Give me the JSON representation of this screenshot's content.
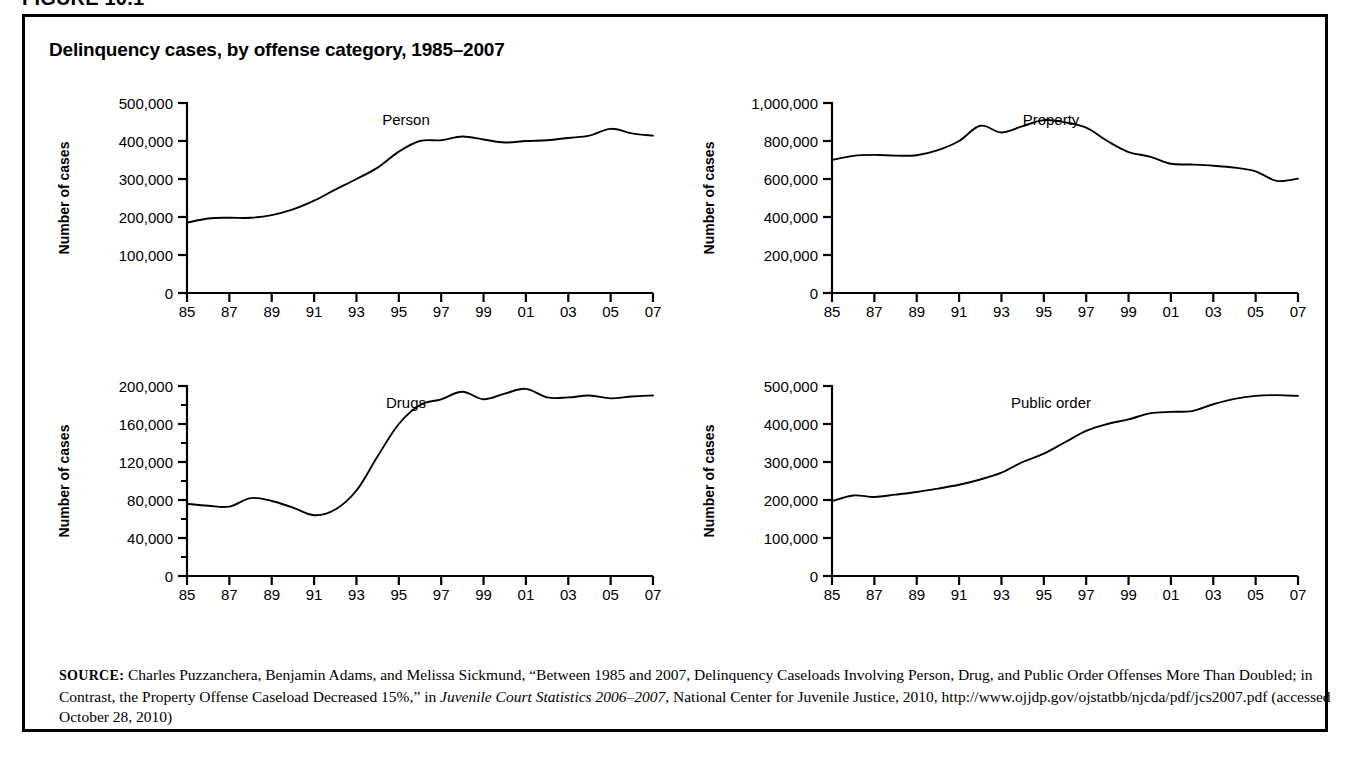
{
  "figure": {
    "number_label": "FIGURE 10.1",
    "title": "Delinquency cases, by offense category, 1985–2007"
  },
  "source": {
    "kicker": "SOURCE:",
    "text_part1": " Charles Puzzanchera, Benjamin Adams, and Melissa Sickmund, “Between 1985 and 2007, Delinquency Caseloads Involving Person, Drug, and Public Order Offenses More Than Doubled; in Contrast, the Property Offense Caseload Decreased 15%,” in ",
    "italic_title": "Juvenile Court Statistics 2006–2007",
    "text_part2": ", National Center for Juvenile Justice, 2010, http://www.ojjdp.gov/ojstatbb/njcda/pdf/jcs2007.pdf (accessed October 28, 2010)"
  },
  "common": {
    "ylabel": "Number of cases",
    "xtick_labels": [
      "85",
      "87",
      "89",
      "91",
      "93",
      "95",
      "97",
      "99",
      "01",
      "03",
      "05",
      "07"
    ],
    "years": [
      1985,
      1986,
      1987,
      1988,
      1989,
      1990,
      1991,
      1992,
      1993,
      1994,
      1995,
      1996,
      1997,
      1998,
      1999,
      2000,
      2001,
      2002,
      2003,
      2004,
      2005,
      2006,
      2007
    ],
    "line_color": "#000000"
  },
  "chart_data": [
    {
      "type": "line",
      "id": "person",
      "title": "Person",
      "series_label": "Person",
      "xlabel": "",
      "ylabel": "Number of cases",
      "x": [
        1985,
        1986,
        1987,
        1988,
        1989,
        1990,
        1991,
        1992,
        1993,
        1994,
        1995,
        1996,
        1997,
        1998,
        1999,
        2000,
        2001,
        2002,
        2003,
        2004,
        2005,
        2006,
        2007
      ],
      "values": [
        185000,
        196000,
        198000,
        198000,
        205000,
        220000,
        243000,
        272000,
        300000,
        330000,
        372000,
        400000,
        402000,
        412000,
        404000,
        396000,
        400000,
        402000,
        408000,
        414000,
        432000,
        420000,
        414000
      ],
      "ylim": [
        0,
        500000
      ],
      "yticks": [
        0,
        100000,
        200000,
        300000,
        400000,
        500000
      ],
      "ytick_labels": [
        "0",
        "100,000",
        "200,000",
        "300,000",
        "400,000",
        "500,000"
      ],
      "minor_yticks": [],
      "xtick_labels": [
        "85",
        "87",
        "89",
        "91",
        "93",
        "95",
        "97",
        "99",
        "01",
        "03",
        "05",
        "07"
      ],
      "grid": false,
      "legend": "none"
    },
    {
      "type": "line",
      "id": "property",
      "title": "Property",
      "series_label": "Property",
      "xlabel": "",
      "ylabel": "Number of cases",
      "x": [
        1985,
        1986,
        1987,
        1988,
        1989,
        1990,
        1991,
        1992,
        1993,
        1994,
        1995,
        1996,
        1997,
        1998,
        1999,
        2000,
        2001,
        2002,
        2003,
        2004,
        2005,
        2006,
        2007
      ],
      "values": [
        700000,
        722000,
        727000,
        723000,
        725000,
        752000,
        800000,
        880000,
        845000,
        878000,
        910000,
        898000,
        870000,
        800000,
        742000,
        718000,
        680000,
        676000,
        670000,
        660000,
        640000,
        590000,
        602000
      ],
      "ylim": [
        0,
        1000000
      ],
      "yticks": [
        0,
        200000,
        400000,
        600000,
        800000,
        1000000
      ],
      "ytick_labels": [
        "0",
        "200,000",
        "400,000",
        "600,000",
        "800,000",
        "1,000,000"
      ],
      "minor_yticks": [],
      "xtick_labels": [
        "85",
        "87",
        "89",
        "91",
        "93",
        "95",
        "97",
        "99",
        "01",
        "03",
        "05",
        "07"
      ],
      "grid": false,
      "legend": "none"
    },
    {
      "type": "line",
      "id": "drugs",
      "title": "Drugs",
      "series_label": "Drugs",
      "xlabel": "",
      "ylabel": "Number of cases",
      "x": [
        1985,
        1986,
        1987,
        1988,
        1989,
        1990,
        1991,
        1992,
        1993,
        1994,
        1995,
        1996,
        1997,
        1998,
        1999,
        2000,
        2001,
        2002,
        2003,
        2004,
        2005,
        2006,
        2007
      ],
      "values": [
        76000,
        74000,
        73000,
        82000,
        79000,
        72000,
        64000,
        70000,
        90000,
        126000,
        160000,
        180000,
        186000,
        194000,
        186000,
        192000,
        197000,
        188000,
        188000,
        190000,
        187000,
        189000,
        190000
      ],
      "ylim": [
        0,
        200000
      ],
      "yticks": [
        0,
        40000,
        80000,
        120000,
        160000,
        200000
      ],
      "ytick_labels": [
        "0",
        "40,000",
        "80,000",
        "120,000",
        "160,000",
        "200,000"
      ],
      "minor_yticks": [
        20000,
        60000,
        100000,
        140000,
        180000
      ],
      "xtick_labels": [
        "85",
        "87",
        "89",
        "91",
        "93",
        "95",
        "97",
        "99",
        "01",
        "03",
        "05",
        "07"
      ],
      "grid": false,
      "legend": "none"
    },
    {
      "type": "line",
      "id": "public-order",
      "title": "Public order",
      "series_label": "Public order",
      "xlabel": "",
      "ylabel": "Number of cases",
      "x": [
        1985,
        1986,
        1987,
        1988,
        1989,
        1990,
        1991,
        1992,
        1993,
        1994,
        1995,
        1996,
        1997,
        1998,
        1999,
        2000,
        2001,
        2002,
        2003,
        2004,
        2005,
        2006,
        2007
      ],
      "values": [
        197000,
        212000,
        208000,
        214000,
        221000,
        230000,
        240000,
        254000,
        272000,
        300000,
        322000,
        352000,
        382000,
        400000,
        412000,
        428000,
        432000,
        434000,
        452000,
        466000,
        474000,
        476000,
        474000
      ],
      "ylim": [
        0,
        500000
      ],
      "yticks": [
        0,
        100000,
        200000,
        300000,
        400000,
        500000
      ],
      "ytick_labels": [
        "0",
        "100,000",
        "200,000",
        "300,000",
        "400,000",
        "500,000"
      ],
      "minor_yticks": [],
      "xtick_labels": [
        "85",
        "87",
        "89",
        "91",
        "93",
        "95",
        "97",
        "99",
        "01",
        "03",
        "05",
        "07"
      ],
      "grid": false,
      "legend": "none"
    }
  ]
}
